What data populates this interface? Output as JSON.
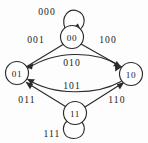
{
  "diagram": {
    "type": "state-transition-graph",
    "colors": {
      "background": "#fdfdfd",
      "stroke": "#2b2b2b",
      "node_fill": "#ffffff",
      "text": "#1a1a1a"
    },
    "nodes": [
      {
        "id": "n00",
        "label": "00",
        "x": 72,
        "y": 37,
        "r": 11.5
      },
      {
        "id": "n01",
        "label": "01",
        "x": 17,
        "y": 73,
        "r": 11.5
      },
      {
        "id": "n10",
        "label": "10",
        "x": 131,
        "y": 74,
        "r": 11.5
      },
      {
        "id": "n11",
        "label": "11",
        "x": 75,
        "y": 113,
        "r": 11.5
      }
    ],
    "edges": [
      {
        "id": "e000",
        "label": "000",
        "from": "00",
        "to": "00",
        "kind": "self-loop",
        "label_x": 47,
        "label_y": 11
      },
      {
        "id": "e001",
        "label": "001",
        "from": "00",
        "to": "01",
        "kind": "line",
        "label_x": 36,
        "label_y": 39
      },
      {
        "id": "e100",
        "label": "100",
        "from": "10",
        "to": "00",
        "kind": "line",
        "label_x": 108,
        "label_y": 39
      },
      {
        "id": "e010",
        "label": "010",
        "from": "01",
        "to": "10",
        "kind": "curve",
        "label_x": 72,
        "label_y": 62
      },
      {
        "id": "e101",
        "label": "101",
        "from": "10",
        "to": "01",
        "kind": "curve",
        "label_x": 72,
        "label_y": 85
      },
      {
        "id": "e011",
        "label": "011",
        "from": "11",
        "to": "01",
        "kind": "line",
        "label_x": 27,
        "label_y": 99
      },
      {
        "id": "e110",
        "label": "110",
        "from": "11",
        "to": "10",
        "kind": "line",
        "label_x": 117,
        "label_y": 99
      },
      {
        "id": "e111",
        "label": "111",
        "from": "11",
        "to": "11",
        "kind": "self-loop",
        "label_x": 52,
        "label_y": 133
      }
    ]
  }
}
